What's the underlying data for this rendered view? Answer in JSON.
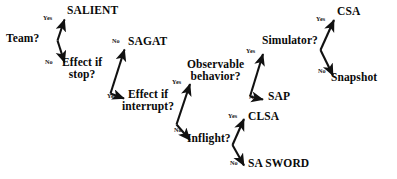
{
  "diagram": {
    "background_color": "#ffffff",
    "text_color": "#0a0a0a",
    "edge_color": "#111111",
    "nodes": [
      {
        "id": "team",
        "kind": "decision",
        "label": "Team?"
      },
      {
        "id": "salient",
        "kind": "terminal",
        "label": "SALIENT"
      },
      {
        "id": "effectstop",
        "kind": "decision",
        "label": "Effect if\nstop?"
      },
      {
        "id": "sagat",
        "kind": "terminal",
        "label": "SAGAT"
      },
      {
        "id": "effectint",
        "kind": "decision",
        "label": "Effect if\ninterrupt?"
      },
      {
        "id": "observable",
        "kind": "decision",
        "label": "Observable\nbehavior?"
      },
      {
        "id": "inflight",
        "kind": "decision",
        "label": "Inflight?"
      },
      {
        "id": "simulator",
        "kind": "decision",
        "label": "Simulator?"
      },
      {
        "id": "sap",
        "kind": "terminal",
        "label": "SAP"
      },
      {
        "id": "csa",
        "kind": "terminal",
        "label": "CSA"
      },
      {
        "id": "snapshot",
        "kind": "terminal",
        "label": "Snapshot"
      },
      {
        "id": "clsa",
        "kind": "terminal",
        "label": "CLSA"
      },
      {
        "id": "sasword",
        "kind": "terminal",
        "label": "SA SWORD"
      }
    ],
    "edges": [
      {
        "from": "team",
        "to": "salient",
        "label": "Yes"
      },
      {
        "from": "team",
        "to": "effectstop",
        "label": "No"
      },
      {
        "from": "effectstop",
        "to": "sagat",
        "label": "No"
      },
      {
        "from": "effectstop",
        "to": "effectint",
        "label": "Yes"
      },
      {
        "from": "effectint",
        "to": "observable",
        "label": "Yes"
      },
      {
        "from": "effectint",
        "to": "inflight",
        "label": "No"
      },
      {
        "from": "observable",
        "to": "simulator",
        "label": "Yes"
      },
      {
        "from": "observable",
        "to": "sap",
        "label": "No"
      },
      {
        "from": "simulator",
        "to": "csa",
        "label": "Yes"
      },
      {
        "from": "simulator",
        "to": "snapshot",
        "label": "No"
      },
      {
        "from": "inflight",
        "to": "clsa",
        "label": "Yes"
      },
      {
        "from": "inflight",
        "to": "sasword",
        "label": "No"
      }
    ]
  }
}
